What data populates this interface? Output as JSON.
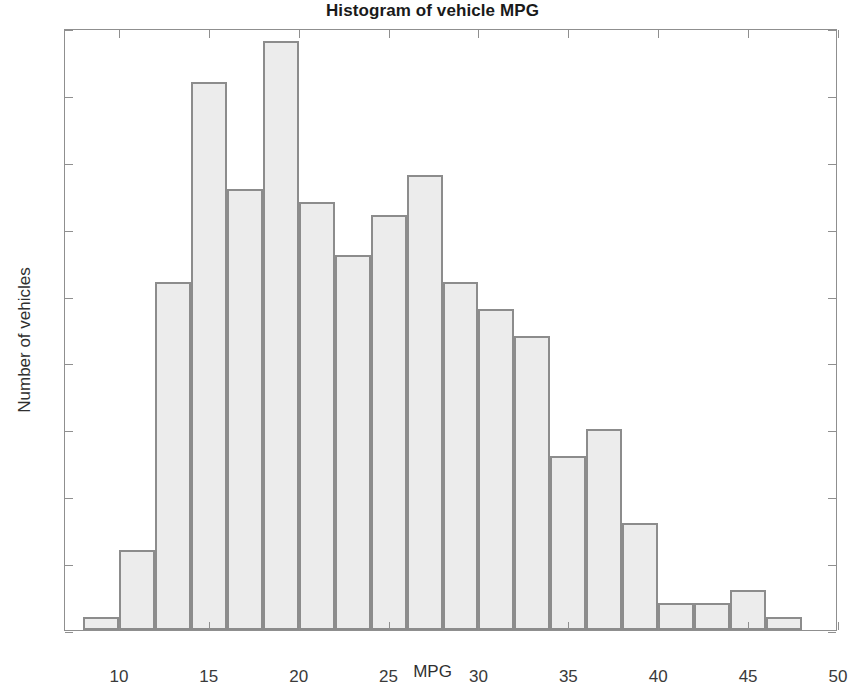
{
  "chart_data": {
    "type": "bar",
    "title": "Histogram of vehicle MPG",
    "xlabel": "MPG",
    "ylabel": "Number of vehicles",
    "xlim": [
      7,
      50
    ],
    "ylim": [
      0,
      45
    ],
    "xticks": [
      10,
      15,
      20,
      25,
      30,
      35,
      40,
      45,
      50
    ],
    "yticks": [
      0,
      5,
      10,
      15,
      20,
      25,
      30,
      35,
      40,
      45
    ],
    "xtick_labels": [
      "10",
      "15",
      "20",
      "25",
      "30",
      "35",
      "40",
      "45",
      "50"
    ],
    "ytick_labels": [
      "0",
      "5",
      "10",
      "15",
      "20",
      "25",
      "30",
      "35",
      "40",
      "45"
    ],
    "grid": false,
    "legend": null,
    "bin_width": 2,
    "bin_edges": [
      8,
      10,
      12,
      14,
      16,
      18,
      20,
      22,
      24,
      26,
      28,
      30,
      32,
      34,
      36,
      38,
      40,
      42,
      44,
      46,
      48
    ],
    "bin_centers": [
      9,
      11,
      13,
      15,
      17,
      19,
      21,
      23,
      25,
      27,
      29,
      31,
      33,
      35,
      37,
      39,
      41,
      43,
      45,
      47
    ],
    "categories": [
      "8-10",
      "10-12",
      "12-14",
      "14-16",
      "16-18",
      "18-20",
      "20-22",
      "22-24",
      "24-26",
      "26-28",
      "28-30",
      "30-32",
      "32-34",
      "34-36",
      "36-38",
      "38-40",
      "40-42",
      "42-44",
      "44-46",
      "46-48"
    ],
    "values": [
      1,
      6,
      26,
      41,
      33,
      44,
      32,
      28,
      31,
      34,
      26,
      24,
      22,
      13,
      15,
      8,
      2,
      2,
      3,
      1
    ],
    "bar_fill_color": "#ececec",
    "bar_edge_color": "#8c8c8c",
    "axis_color": "#8f8f8f",
    "text_color": "#2f2f2f"
  }
}
